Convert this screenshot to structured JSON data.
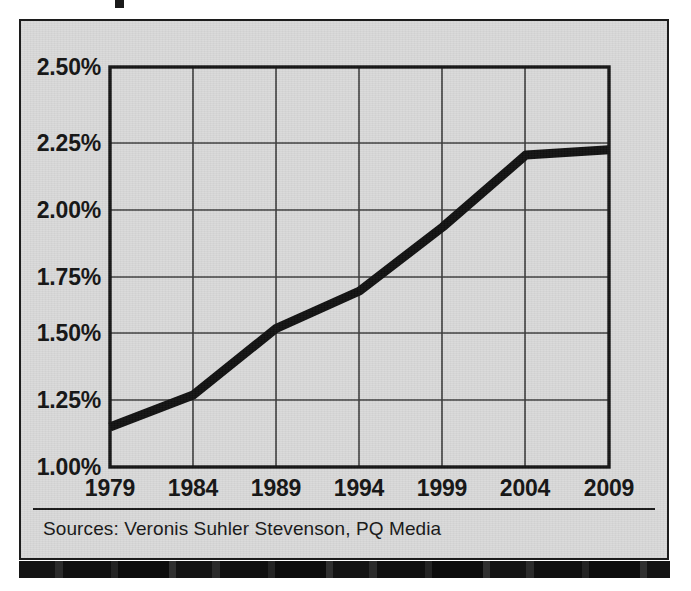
{
  "figure": {
    "background_color": "#d9d9d9",
    "frame_color": "#1c1c1c",
    "source_note": "Sources: Veronis Suhler Stevenson,  PQ Media"
  },
  "chart_data": {
    "type": "line",
    "title": "",
    "xlabel": "",
    "ylabel": "",
    "x": [
      1979,
      1984,
      1989,
      1994,
      1999,
      2004,
      2009
    ],
    "xtick_labels": [
      "1979",
      "1984",
      "1989",
      "1994",
      "1999",
      "2004",
      "2009"
    ],
    "ytick_labels": [
      "2.50%",
      "2.25%",
      "2.00%",
      "1.75%",
      "1.50%",
      "1.25%",
      "1.00%"
    ],
    "ytick_values": [
      2.5,
      2.25,
      2.0,
      1.75,
      1.5,
      1.25,
      1.0
    ],
    "ylim": [
      1.0,
      2.5
    ],
    "xlim": [
      1979,
      2009
    ],
    "grid": true,
    "legend": "none",
    "series": [
      {
        "name": "Share",
        "color": "#101010",
        "line_width": 9,
        "values": [
          1.15,
          1.27,
          1.52,
          1.66,
          1.9,
          2.17,
          2.19
        ]
      }
    ]
  }
}
